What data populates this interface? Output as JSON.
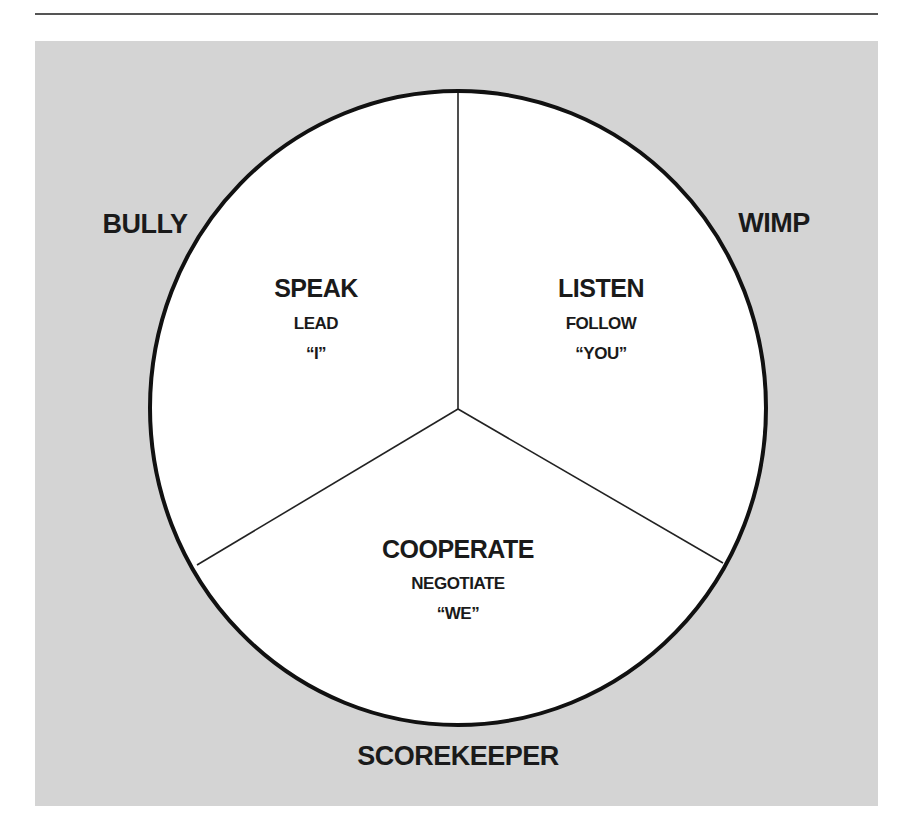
{
  "diagram": {
    "colors": {
      "panel": "#d4d4d4",
      "circle_fill": "#ffffff",
      "stroke": "#111111",
      "rule": "#555555",
      "text": "#1a1a1a"
    },
    "outer_labels": {
      "top_left": "BULLY",
      "top_right": "WIMP",
      "bottom": "SCOREKEEPER"
    },
    "segments": [
      {
        "id": "left",
        "title": "SPEAK",
        "subtitle": "LEAD",
        "pronoun": "“I”"
      },
      {
        "id": "right",
        "title": "LISTEN",
        "subtitle": "FOLLOW",
        "pronoun": "“YOU”"
      },
      {
        "id": "bottom",
        "title": "COOPERATE",
        "subtitle": "NEGOTIATE",
        "pronoun": "“WE”"
      }
    ]
  }
}
